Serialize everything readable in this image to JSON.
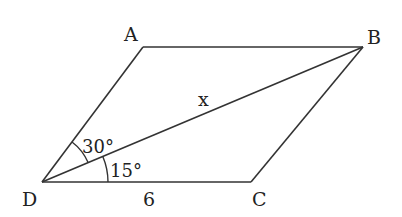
{
  "diagram": {
    "type": "parallelogram",
    "vertices": {
      "A": {
        "label": "A",
        "x": 143,
        "y": 47
      },
      "B": {
        "label": "B",
        "x": 363,
        "y": 47
      },
      "C": {
        "label": "C",
        "x": 251,
        "y": 182
      },
      "D": {
        "label": "D",
        "x": 42,
        "y": 182
      }
    },
    "diagonal": {
      "from": "D",
      "to": "B",
      "label": "x"
    },
    "side_DC_label": "6",
    "angles": [
      {
        "between": "AD-DB",
        "label": "30°"
      },
      {
        "between": "DB-DC",
        "label": "15°"
      }
    ],
    "line_color": "#333333"
  }
}
